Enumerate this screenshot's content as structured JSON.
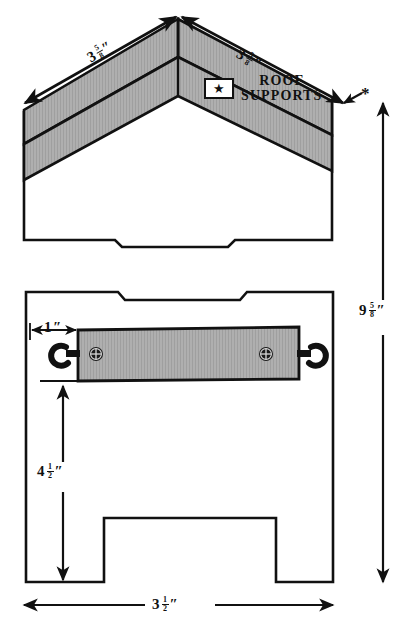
{
  "figure": {
    "type": "technical-woodworking-plan",
    "units": "inches",
    "fill_color": "#ababab",
    "line_color": "#111111",
    "background": "#ffffff"
  },
  "callout": {
    "icon": "star-icon",
    "star_glyph": "★",
    "line1": "ROOF",
    "line2": "SUPPORTS"
  },
  "markers": {
    "asterisk": "*"
  },
  "dimensions": {
    "roof_left": {
      "whole": "3",
      "num": "5",
      "den": "8",
      "inch": "″",
      "text": "3 5/8″"
    },
    "roof_right": {
      "whole": "3",
      "num": "5",
      "den": "8",
      "inch": "″",
      "text": "3 5/8″"
    },
    "height_total": {
      "whole": "9",
      "num": "5",
      "den": "8",
      "inch": "″",
      "text": "9 5/8″"
    },
    "inset_left": {
      "whole": "1",
      "num": "",
      "den": "",
      "inch": "″",
      "text": "1″"
    },
    "height_to_support": {
      "whole": "4",
      "num": "1",
      "den": "2",
      "inch": "″",
      "text": "4 1/2″"
    },
    "width_bottom": {
      "whole": "3",
      "num": "1",
      "den": "2",
      "inch": "″",
      "text": "3 1/2″"
    }
  },
  "hardware": {
    "screw_eye_left": "screw-hook-icon",
    "screw_eye_right": "screw-hook-icon",
    "screw_head_left": "phillips-screw-icon",
    "screw_head_right": "phillips-screw-icon"
  },
  "views": {
    "top": "front-elevation-gable-roof",
    "bottom": "front-elevation-with-support-bar"
  }
}
